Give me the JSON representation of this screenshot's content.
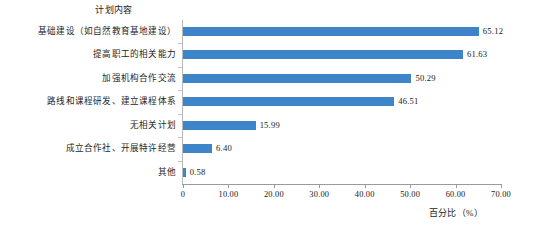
{
  "chart_data": {
    "type": "bar",
    "orientation": "horizontal",
    "title": "计划内容",
    "xlabel": "百分比（%）",
    "ylabel": "",
    "xlim": [
      0,
      70
    ],
    "xticks": [
      "0",
      "10.00",
      "20.00",
      "30.00",
      "40.00",
      "50.00",
      "60.00",
      "70.00"
    ],
    "xtick_values": [
      0,
      10,
      20,
      30,
      40,
      50,
      60,
      70
    ],
    "grid": false,
    "legend": false,
    "series_color": "#3d85c8",
    "categories": [
      "基础建设（如自然教育基地建设）",
      "提高职工的相关能力",
      "加强机构合作交流",
      "路线和课程研发、建立课程体系",
      "无相关计划",
      "成立合作社、开展特许经营",
      "其他"
    ],
    "values": [
      65.12,
      61.63,
      50.29,
      46.51,
      15.99,
      6.4,
      0.58
    ],
    "value_labels": [
      "65.12",
      "61.63",
      "50.29",
      "46.51",
      "15.99",
      "6.40",
      "0.58"
    ]
  }
}
